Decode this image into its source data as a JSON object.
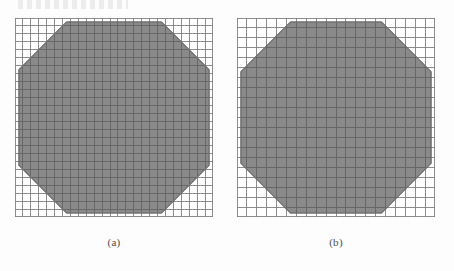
{
  "figure": {
    "background_color": "#fdfdfd",
    "panels": [
      {
        "id": "a",
        "caption": "(a)",
        "grid": {
          "cols": 25,
          "rows": 25,
          "cell_px": 7.92,
          "line_color": "#6e6e6e",
          "line_width": 0.9,
          "width_px": 198,
          "height_px": 199
        },
        "shape": {
          "type": "octagon",
          "fill_color": "#8a8a8a",
          "edge_color": "#787878",
          "chamfer_cells": 6,
          "inset_left_cells": 0.5,
          "inset_right_cells": 0.5,
          "inset_top_cells": 0.5,
          "inset_bottom_cells": 0.5
        }
      },
      {
        "id": "b",
        "caption": "(b)",
        "grid": {
          "cols": 20,
          "rows": 20,
          "cell_px": 9.9,
          "line_color": "#6e6e6e",
          "line_width": 0.9,
          "width_px": 198,
          "height_px": 199
        },
        "shape": {
          "type": "octagon",
          "fill_color": "#8a8a8a",
          "edge_color": "#787878",
          "chamfer_cells": 5,
          "inset_left_cells": 0.4,
          "inset_right_cells": 0.4,
          "inset_top_cells": 0.4,
          "inset_bottom_cells": 0.4
        }
      }
    ]
  },
  "chart_data": {
    "type": "heatmap",
    "title": "",
    "subtitle": "",
    "xlabel": "",
    "ylabel": "",
    "grid": true,
    "legend": "none",
    "panels": [
      {
        "name": "(a)",
        "nx": 25,
        "ny": 25,
        "xlim": [
          0,
          25
        ],
        "ylim": [
          0,
          25
        ],
        "domain": "octagon",
        "chamfer_cells": 6,
        "shaded_cell_count": 553,
        "total_cell_count": 625,
        "fill_color": "#8a8a8a"
      },
      {
        "name": "(b)",
        "nx": 20,
        "ny": 20,
        "xlim": [
          0,
          20
        ],
        "ylim": [
          0,
          20
        ],
        "domain": "octagon",
        "chamfer_cells": 5,
        "shaded_cell_count": 350,
        "total_cell_count": 400,
        "fill_color": "#8a8a8a"
      }
    ]
  }
}
